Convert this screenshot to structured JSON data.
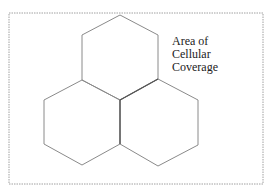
{
  "diagram": {
    "label_lines": [
      "Area of",
      "Cellular",
      "Coverage"
    ],
    "colors": {
      "background": "#ffffff",
      "frame": "#a0a0a0",
      "hex_stroke": "#8a8a8a",
      "shared_edge": "#555555",
      "text": "#222222"
    },
    "cells": [
      {
        "name": "top-cell",
        "points": "120,15 158,35 158,79 120,100 82,80 82,35"
      },
      {
        "name": "left-cell",
        "points": "82,80 120,100 120,144 82,165 44,144 44,100"
      },
      {
        "name": "right-cell",
        "points": "158,79 198,100 198,145 158,166 120,144 120,100"
      }
    ]
  }
}
